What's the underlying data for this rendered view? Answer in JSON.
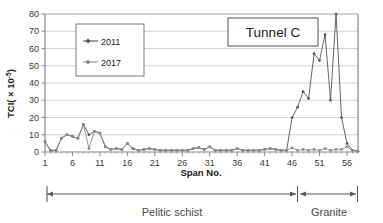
{
  "chart_data": {
    "type": "line",
    "title": "Tunnel C",
    "xlabel": "Span No.",
    "ylabel": "TCI( × 10-5)",
    "ylabel_prefix": "TCI( × 10",
    "ylabel_exponent": "-5",
    "ylabel_suffix": ")",
    "xlim": [
      1,
      58
    ],
    "ylim": [
      0,
      80
    ],
    "grid": "horizontal",
    "legend_position": "upper-left",
    "yticks": [
      0,
      10,
      20,
      30,
      40,
      50,
      60,
      70,
      80
    ],
    "xticks": [
      1,
      6,
      11,
      16,
      21,
      26,
      31,
      36,
      41,
      46,
      51,
      56
    ],
    "x": [
      1,
      2,
      3,
      4,
      5,
      6,
      7,
      8,
      9,
      10,
      11,
      12,
      13,
      14,
      15,
      16,
      17,
      18,
      19,
      20,
      21,
      22,
      23,
      24,
      25,
      26,
      27,
      28,
      29,
      30,
      31,
      32,
      33,
      34,
      35,
      36,
      37,
      38,
      39,
      40,
      41,
      42,
      43,
      44,
      45,
      46,
      47,
      48,
      49,
      50,
      51,
      52,
      53,
      54,
      55,
      56,
      57,
      58
    ],
    "series": [
      {
        "name": "2011",
        "color": "#555555",
        "values": [
          6,
          1,
          1,
          8,
          10,
          9,
          8,
          16,
          10,
          12,
          11,
          3,
          1.5,
          2,
          1.5,
          5,
          2,
          1,
          1.5,
          2,
          1.5,
          1,
          1,
          1,
          1,
          1,
          1,
          2,
          2.5,
          1.5,
          3,
          1,
          1,
          1,
          1,
          2,
          1,
          1,
          1,
          1,
          1.5,
          2,
          1.5,
          1,
          1,
          20,
          26,
          35,
          31,
          57,
          53,
          68,
          30,
          80,
          20,
          5,
          1,
          0.5
        ]
      },
      {
        "name": "2017",
        "color": "#8c8c8c",
        "values": [
          6,
          0.5,
          1,
          8,
          10,
          9,
          8,
          16,
          2,
          12,
          11,
          3,
          1.5,
          2,
          1.5,
          5,
          2,
          1,
          1.5,
          2,
          1.5,
          1,
          1,
          1,
          1,
          1,
          1,
          2,
          2.5,
          1.5,
          3,
          1,
          1,
          1,
          1,
          2,
          1,
          1,
          1,
          1,
          1.5,
          2,
          1.5,
          1,
          1,
          2.5,
          1,
          1.5,
          1,
          1.5,
          1,
          2,
          1,
          1.5,
          1.5,
          3,
          1,
          0.5
        ]
      }
    ],
    "annotations": [
      {
        "name": "pelitic-schist-span",
        "label": "Pelitic schist",
        "from": 1,
        "to": 44.5
      },
      {
        "name": "granite-span",
        "label": "Granite",
        "from": 44.5,
        "to": 58
      }
    ]
  },
  "legend": {
    "items": [
      {
        "label": "2011",
        "color": "#555555"
      },
      {
        "label": "2017",
        "color": "#8c8c8c"
      }
    ]
  },
  "callout": {
    "label": "Tunnel C"
  },
  "colors": {
    "axis": "#8a8a8a",
    "grid": "#c9c9c9",
    "text": "#3a3a3a",
    "series_2011": "#555555",
    "series_2017": "#8c8c8c",
    "annotation": "#5a5a5a"
  }
}
